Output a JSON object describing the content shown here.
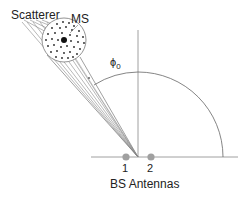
{
  "figure": {
    "labels": {
      "scatterer": "Scatterer",
      "ms": "MS",
      "angle_symbol": "ϕ",
      "angle_subscript": "0",
      "antenna_1": "1",
      "antenna_2": "2",
      "bs_antennas": "BS Antennas"
    },
    "colors": {
      "line": "#777777",
      "antenna": "#a0a0a0",
      "dots": "#222222",
      "text": "#222222"
    }
  }
}
